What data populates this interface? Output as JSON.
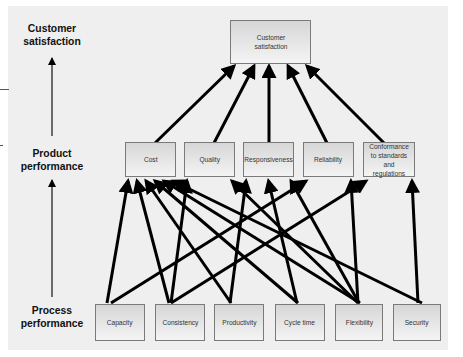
{
  "levels": {
    "customer": "Customer satisfaction",
    "product": "Product performance",
    "process": "Process performance"
  },
  "customer_box": {
    "label": "Customer satisfaction"
  },
  "product_boxes": [
    {
      "id": "cost",
      "label": "Cost"
    },
    {
      "id": "quality",
      "label": "Quality"
    },
    {
      "id": "responsiveness",
      "label": "Responsiveness"
    },
    {
      "id": "reliability",
      "label": "Reliability"
    },
    {
      "id": "conformance",
      "label": "Conformance to standards and regulations"
    }
  ],
  "process_boxes": [
    {
      "id": "capacity",
      "label": "Capacity"
    },
    {
      "id": "consistency",
      "label": "Consistency"
    },
    {
      "id": "productivity",
      "label": "Productivity"
    },
    {
      "id": "cycle_time",
      "label": "Cycle time"
    },
    {
      "id": "flexibility",
      "label": "Flexibility"
    },
    {
      "id": "security",
      "label": "Security"
    }
  ],
  "links_product_to_customer": [
    "cost",
    "quality",
    "responsiveness",
    "reliability",
    "conformance"
  ],
  "links_process_to_product": [
    [
      "capacity",
      "cost"
    ],
    [
      "capacity",
      "reliability"
    ],
    [
      "consistency",
      "cost"
    ],
    [
      "consistency",
      "quality"
    ],
    [
      "consistency",
      "conformance"
    ],
    [
      "productivity",
      "cost"
    ],
    [
      "productivity",
      "responsiveness"
    ],
    [
      "cycle_time",
      "cost"
    ],
    [
      "cycle_time",
      "responsiveness"
    ],
    [
      "flexibility",
      "cost"
    ],
    [
      "flexibility",
      "quality"
    ],
    [
      "flexibility",
      "responsiveness"
    ],
    [
      "flexibility",
      "reliability"
    ],
    [
      "security",
      "cost"
    ],
    [
      "security",
      "conformance"
    ]
  ],
  "colors": {
    "panel": "#efefef",
    "arrow": "#000000",
    "box_border": "#7a7a7a"
  }
}
